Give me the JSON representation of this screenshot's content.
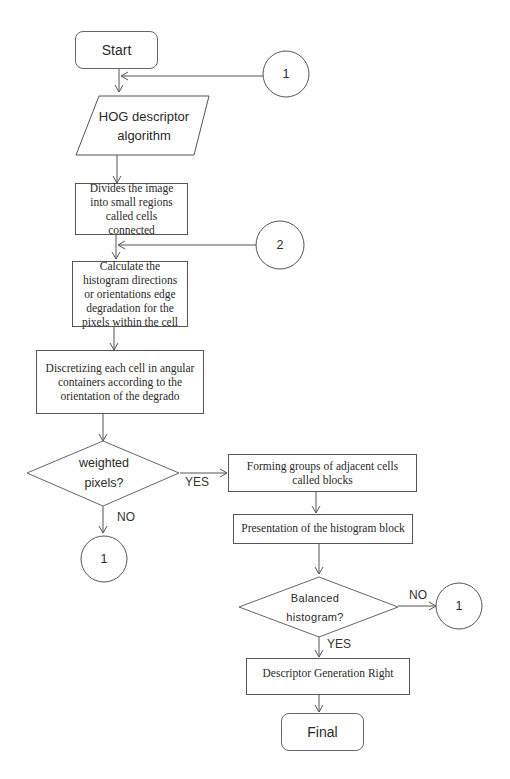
{
  "diagram": {
    "type": "flowchart",
    "nodes": {
      "start": "Start",
      "hog": "HOG descriptor\nalgorithm",
      "divide": "Divides the image into small regions called cells connected",
      "calc": "Calculate the histogram directions or orientations edge degradation for the pixels within the cell",
      "discretize": "Discretizing each cell in angular containers according to the orientation of the degrado",
      "weighted": "weighted\npixels?",
      "forming": "Forming groups of adjacent cells called blocks",
      "presentation": "Presentation of the histogram block",
      "balanced": "Balanced\nhistogram?",
      "descriptor": "Descriptor Generation Right",
      "final": "Final"
    },
    "connectors": {
      "c1_top": "1",
      "c2": "2",
      "c1_left": "1",
      "c1_right": "1"
    },
    "edge_labels": {
      "weighted_yes": "YES",
      "weighted_no": "NO",
      "balanced_no": "NO",
      "balanced_yes": "YES"
    },
    "colors": {
      "stroke": "#555555",
      "text": "#2a2a2a",
      "background": "#ffffff"
    }
  }
}
